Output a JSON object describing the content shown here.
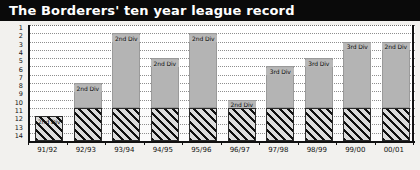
{
  "header": {
    "title": "The Borderers' ten year league record"
  },
  "chart_data": {
    "type": "bar",
    "title": "The Borderers' ten year league record",
    "xlabel": "",
    "ylabel": "",
    "categories": [
      "91/92",
      "92/93",
      "93/94",
      "94/95",
      "95/96",
      "96/97",
      "97/98",
      "98/99",
      "99/00",
      "00/01"
    ],
    "values": [
      12,
      8,
      2,
      5,
      2,
      10,
      6,
      5,
      3,
      3
    ],
    "labels": [
      "2nd Div",
      "2nd Div",
      "2nd Div",
      "2nd Div",
      "2nd Div",
      "2nd Div",
      "3rd Div",
      "3rd Div",
      "3rd Div",
      "2nd Div"
    ],
    "divisions": [
      "2nd Div",
      "2nd Div",
      "2nd Div",
      "2nd Div",
      "2nd Div",
      "2nd Div",
      "3rd Div",
      "3rd Div",
      "3rd Div",
      "2nd Div"
    ],
    "ylim": [
      1,
      14
    ],
    "yticks": [
      "1",
      "2",
      "3",
      "4",
      "5",
      "6",
      "7",
      "8",
      "9",
      "10",
      "11",
      "12",
      "13",
      "14"
    ],
    "y_axis_inverted": true,
    "baseline": 14,
    "hatch_start_position": 11,
    "grid": true,
    "legend": "none",
    "series": [
      {
        "name": "League position",
        "values": [
          12,
          8,
          2,
          5,
          2,
          10,
          6,
          5,
          3,
          3
        ]
      }
    ],
    "annotations": [
      {
        "category": "91/92",
        "text": "2nd Div",
        "position": 12
      },
      {
        "category": "92/93",
        "text": "2nd Div",
        "position": 8
      },
      {
        "category": "93/94",
        "text": "2nd Div",
        "position": 2
      },
      {
        "category": "94/95",
        "text": "2nd Div",
        "position": 5
      },
      {
        "category": "95/96",
        "text": "2nd Div",
        "position": 2
      },
      {
        "category": "96/97",
        "text": "2nd Div",
        "position": 10
      },
      {
        "category": "97/98",
        "text": "3rd Div",
        "position": 6
      },
      {
        "category": "98/99",
        "text": "3rd Div",
        "position": 5
      },
      {
        "category": "99/00",
        "text": "3rd Div",
        "position": 3
      },
      {
        "category": "00/01",
        "text": "2nd Div",
        "position": 3
      }
    ]
  },
  "colors": {
    "title_bar": "#0a0a0a",
    "title_text": "#ffffff",
    "bar_solid": "#b4b4b4",
    "bar_hatch_bg": "#d7d7d7",
    "bar_hatch_line": "#101010",
    "axis": "#111111",
    "gridline": "#8e8e8e",
    "plot_bg": "#ffffff",
    "page_bg": "#f2f1ee"
  }
}
